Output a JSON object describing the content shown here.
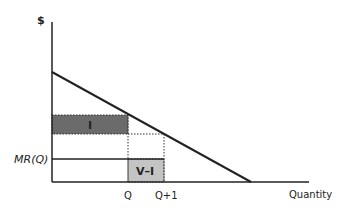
{
  "diagram": {
    "y_axis_label": "$",
    "x_axis_label": "Quantity",
    "mr_label": "MR(Q)",
    "tick_q": "Q",
    "tick_q1": "Q+1",
    "box_i_label": "I",
    "box_vi_label": "V–I",
    "colors": {
      "axis": "#222222",
      "box_i_fill": "#6b6b6b",
      "box_vi_fill": "#c4c4c4",
      "dotted": "#333333"
    }
  }
}
